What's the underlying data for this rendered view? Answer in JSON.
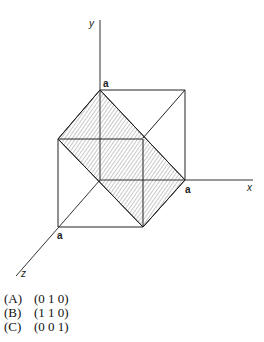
{
  "diagram": {
    "axes": {
      "x": "x",
      "y": "y",
      "z": "z"
    },
    "intercept_label": "a"
  },
  "options": [
    {
      "key": "(A)",
      "value": "(0 1 0)"
    },
    {
      "key": "(B)",
      "value": "(1 1 0)"
    },
    {
      "key": "(C)",
      "value": "(0 0 1)"
    }
  ]
}
